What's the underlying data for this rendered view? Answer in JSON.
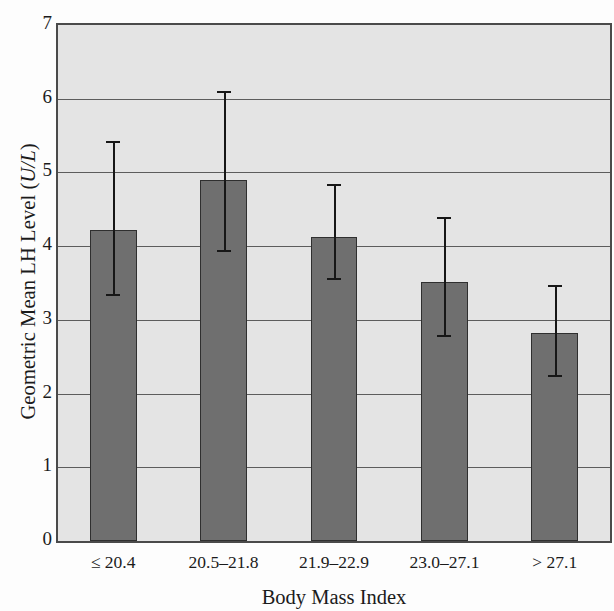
{
  "chart_data": {
    "type": "bar",
    "title": "",
    "xlabel": "Body Mass Index",
    "ylabel_full": "Geometric Mean LH Level (U/L)",
    "ylabel_main": "Geometric Mean LH Level (",
    "ylabel_unit": "U/L",
    "ylabel_close": ")",
    "categories": [
      "≤ 20.4",
      "20.5–21.8",
      "21.9–22.9",
      "23.0–27.1",
      "> 27.1"
    ],
    "values": [
      4.22,
      4.9,
      4.12,
      3.51,
      2.82
    ],
    "error_upper": [
      5.42,
      6.1,
      4.84,
      4.39,
      3.47
    ],
    "error_lower": [
      3.35,
      3.95,
      3.57,
      2.8,
      2.25
    ],
    "ylim": [
      0,
      7
    ],
    "yticks": [
      7,
      6,
      5,
      4,
      3,
      2,
      1,
      0
    ],
    "ytick_labels": [
      "7",
      "6",
      "5",
      "4",
      "3",
      "2",
      "1",
      "0"
    ],
    "grid": true,
    "grid_axis": "y",
    "legend": "none",
    "bar_color": "#6f6f6f",
    "bar_edge_color": "#2f2f2f",
    "plot_background": "#e4e4e4",
    "gridline_color": "#5c5c5c",
    "error_color": "#171717",
    "axis_color": "#4a4a4a"
  }
}
